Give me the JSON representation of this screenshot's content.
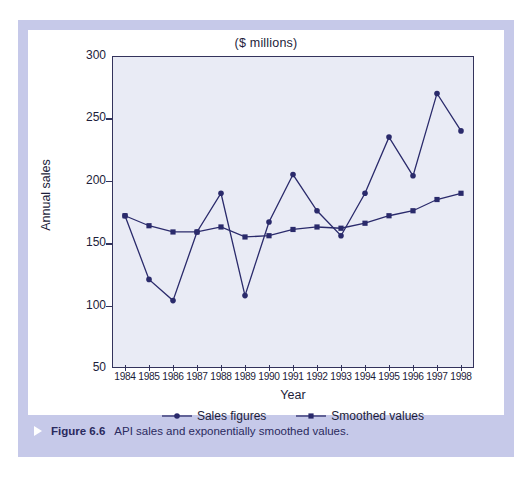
{
  "figure": {
    "caption_marker": "triangle-right-icon",
    "caption_number": "Figure 6.6",
    "caption_text": "API sales and exponentially smoothed values."
  },
  "colors": {
    "frame": "#c6c9e9",
    "plot_background": "#e9ebf5",
    "axis": "#33335c",
    "series_sales": "#2a2a6b",
    "series_smoothed": "#2a2a6b",
    "text": "#1d1d3a",
    "caption_text": "#2a2a5e"
  },
  "chart_data": {
    "type": "line",
    "title": "($ millions)",
    "xlabel": "Year",
    "ylabel": "Annual sales",
    "grid": false,
    "legend_position": "bottom",
    "xlim": [
      1983.5,
      1998.5
    ],
    "ylim": [
      50,
      300
    ],
    "yticks": [
      50,
      100,
      150,
      200,
      250,
      300
    ],
    "ytick_labels": [
      "50",
      "100",
      "150",
      "200",
      "250",
      "300"
    ],
    "categories": [
      1984,
      1985,
      1986,
      1987,
      1988,
      1989,
      1990,
      1991,
      1992,
      1993,
      1994,
      1995,
      1996,
      1997,
      1998
    ],
    "xtick_labels": [
      "1984",
      "1985",
      "1986",
      "1987",
      "1988",
      "1989",
      "1990",
      "1991",
      "1992",
      "1993",
      "1994",
      "1995",
      "1996",
      "1997",
      "1998"
    ],
    "series": [
      {
        "name": "Sales figures",
        "marker": "diamond",
        "values": [
          172,
          121,
          104,
          159,
          190,
          108,
          167,
          205,
          176,
          156,
          190,
          235,
          204,
          270,
          240
        ]
      },
      {
        "name": "Smoothed values",
        "marker": "square",
        "values": [
          172,
          164,
          159,
          159,
          163,
          155,
          156,
          161,
          163,
          162,
          166,
          172,
          176,
          185,
          190
        ]
      }
    ]
  }
}
